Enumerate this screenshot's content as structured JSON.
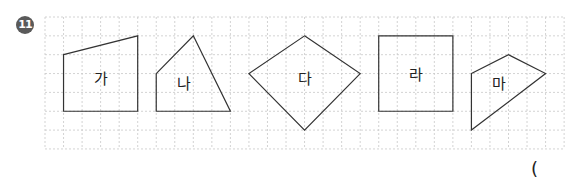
{
  "problem": {
    "number": "11",
    "answer_open_paren": "("
  },
  "grid": {
    "columns": 28,
    "rows": 7
  },
  "shapes": [
    {
      "id": "ga",
      "label": "가",
      "vertices": [
        [
          1,
          2
        ],
        [
          5,
          1
        ],
        [
          5,
          5
        ],
        [
          1,
          5
        ]
      ]
    },
    {
      "id": "na",
      "label": "나",
      "vertices": [
        [
          6,
          3
        ],
        [
          8,
          1
        ],
        [
          10,
          5
        ],
        [
          6,
          5
        ]
      ]
    },
    {
      "id": "da",
      "label": "다",
      "vertices": [
        [
          14,
          1
        ],
        [
          17,
          3
        ],
        [
          14,
          6
        ],
        [
          11,
          3
        ]
      ]
    },
    {
      "id": "ra",
      "label": "라",
      "vertices": [
        [
          18,
          1
        ],
        [
          22,
          1
        ],
        [
          22,
          5
        ],
        [
          18,
          5
        ]
      ]
    },
    {
      "id": "ma",
      "label": "마",
      "vertices": [
        [
          23,
          3
        ],
        [
          25,
          2
        ],
        [
          27,
          3
        ],
        [
          23,
          6
        ]
      ]
    }
  ],
  "colors": {
    "grid": "#c8c8c8",
    "stroke": "#333333",
    "badge": "#5a5a5a"
  }
}
